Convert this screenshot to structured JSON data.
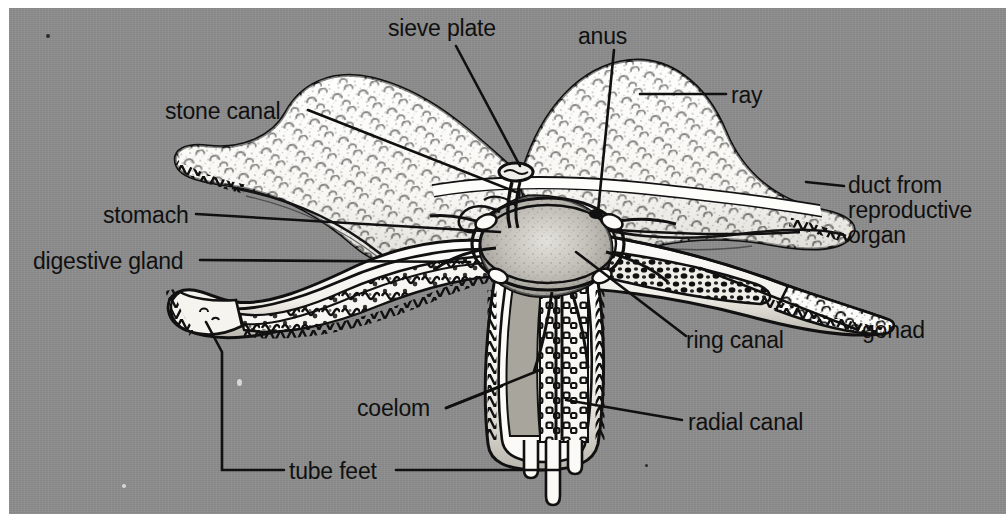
{
  "figure": {
    "background_color": "#8d8d8d",
    "ink_color": "#101010",
    "paper_color": "#ffffff",
    "style": "black-and-white stipple engraving on gray scanned page"
  },
  "labels": [
    {
      "id": "sieve-plate",
      "text": "sieve plate"
    },
    {
      "id": "anus",
      "text": "anus"
    },
    {
      "id": "ray",
      "text": "ray"
    },
    {
      "id": "stone-canal",
      "text": "stone canal"
    },
    {
      "id": "duct-line-1",
      "text": "duct from"
    },
    {
      "id": "duct-line-2",
      "text": "reproductive"
    },
    {
      "id": "duct-line-3",
      "text": "organ"
    },
    {
      "id": "stomach",
      "text": "stomach"
    },
    {
      "id": "digestive-gland",
      "text": "digestive gland"
    },
    {
      "id": "ring-canal",
      "text": "ring canal"
    },
    {
      "id": "gonad",
      "text": "gonad"
    },
    {
      "id": "coelom",
      "text": "coelom"
    },
    {
      "id": "radial-canal",
      "text": "radial canal"
    },
    {
      "id": "tube-feet",
      "text": "tube feet"
    }
  ],
  "structures": [
    {
      "id": "ray",
      "name": "ray"
    },
    {
      "id": "sieve-plate",
      "name": "sieve plate (madreporite)"
    },
    {
      "id": "anus",
      "name": "anus"
    },
    {
      "id": "stone-canal",
      "name": "stone canal"
    },
    {
      "id": "stomach",
      "name": "stomach"
    },
    {
      "id": "digestive-gland",
      "name": "digestive gland (pyloric caeca)"
    },
    {
      "id": "gonad",
      "name": "gonad"
    },
    {
      "id": "duct",
      "name": "duct from reproductive organ"
    },
    {
      "id": "ring-canal",
      "name": "ring canal"
    },
    {
      "id": "radial-canal",
      "name": "radial canal"
    },
    {
      "id": "coelom",
      "name": "coelom"
    },
    {
      "id": "tube-feet",
      "name": "tube feet"
    }
  ]
}
